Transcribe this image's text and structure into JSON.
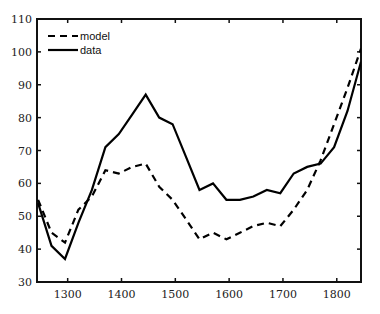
{
  "chart_data": {
    "type": "line",
    "title": "",
    "xlabel": "",
    "ylabel": "",
    "xlim": [
      1243,
      1845
    ],
    "ylim": [
      30,
      110
    ],
    "x_ticks": [
      1300,
      1400,
      1500,
      1600,
      1700,
      1800
    ],
    "y_ticks": [
      30,
      40,
      50,
      60,
      70,
      80,
      90,
      100,
      110
    ],
    "grid": false,
    "legend_position": "upper left",
    "x": [
      1245,
      1270,
      1295,
      1320,
      1345,
      1370,
      1395,
      1420,
      1445,
      1470,
      1495,
      1520,
      1545,
      1570,
      1595,
      1620,
      1645,
      1670,
      1695,
      1720,
      1745,
      1770,
      1795,
      1820,
      1845
    ],
    "series": [
      {
        "name": "model",
        "style": "dashed",
        "color": "#000000",
        "values": [
          55,
          45,
          42,
          52,
          56,
          64,
          63,
          65,
          66,
          59,
          55,
          49,
          43,
          45,
          43,
          45,
          47,
          48,
          47,
          52,
          58,
          67,
          78,
          89,
          101
        ]
      },
      {
        "name": "data",
        "style": "solid",
        "color": "#000000",
        "values": [
          54,
          41,
          37,
          48,
          58,
          71,
          75,
          81,
          87,
          80,
          78,
          68,
          58,
          60,
          55,
          55,
          56,
          58,
          57,
          63,
          65,
          66,
          71,
          82,
          97
        ]
      }
    ]
  }
}
